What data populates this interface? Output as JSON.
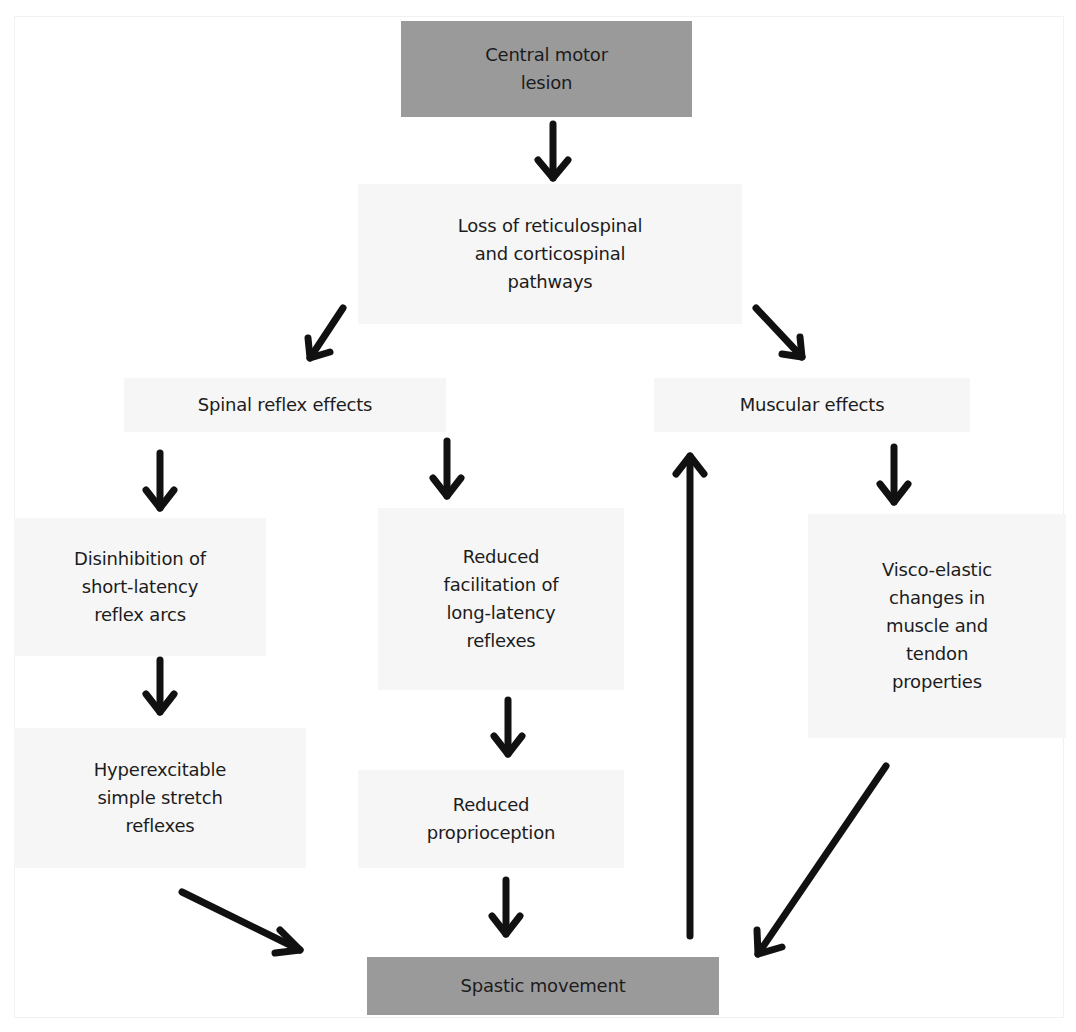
{
  "diagram": {
    "nodes": {
      "central_motor_lesion": "Central motor\nlesion",
      "loss_of_pathways": "Loss of reticulospinal\nand corticospinal\npathways",
      "spinal_reflex_effects": "Spinal reflex effects",
      "muscular_effects": "Muscular effects",
      "disinhibition": "Disinhibition of\nshort-latency\nreflex arcs",
      "reduced_facilitation": "Reduced\nfacilitation of\nlong-latency\nreflexes",
      "visco_elastic": "Visco-elastic\nchanges in\nmuscle and\ntendon\nproperties",
      "hyperexcitable": "Hyperexcitable\nsimple stretch\nreflexes",
      "reduced_proprioception": "Reduced\nproprioception",
      "spastic_movement": "Spastic movement"
    },
    "colors": {
      "terminal_node_fill": "#9a9a9a",
      "intermediate_node_fill": "#f6f6f6",
      "arrow": "#111111"
    },
    "edges": [
      {
        "from": "central_motor_lesion",
        "to": "loss_of_pathways"
      },
      {
        "from": "loss_of_pathways",
        "to": "spinal_reflex_effects"
      },
      {
        "from": "loss_of_pathways",
        "to": "muscular_effects"
      },
      {
        "from": "spinal_reflex_effects",
        "to": "disinhibition"
      },
      {
        "from": "spinal_reflex_effects",
        "to": "reduced_facilitation"
      },
      {
        "from": "muscular_effects",
        "to": "visco_elastic"
      },
      {
        "from": "disinhibition",
        "to": "hyperexcitable"
      },
      {
        "from": "reduced_facilitation",
        "to": "reduced_proprioception"
      },
      {
        "from": "hyperexcitable",
        "to": "spastic_movement"
      },
      {
        "from": "reduced_proprioception",
        "to": "spastic_movement"
      },
      {
        "from": "visco_elastic",
        "to": "spastic_movement"
      },
      {
        "from": "spastic_movement",
        "to": "muscular_effects"
      }
    ]
  }
}
